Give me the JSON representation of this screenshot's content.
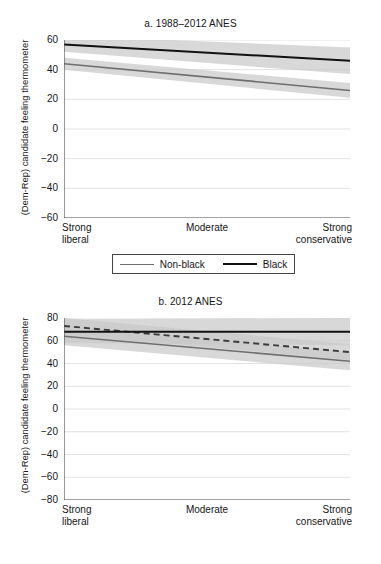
{
  "figure": {
    "background": "#ffffff",
    "colors": {
      "black_line": "#111111",
      "nonblack_line": "#6e6e6e",
      "online_line": "#3a3a3a",
      "ci_band": "#c9c9c9",
      "gridline": "#e2e2e2",
      "axis": "#555555",
      "text": "#151515"
    }
  },
  "chart_data": [
    {
      "type": "line",
      "panel": "a",
      "title": "a. 1988–2012 ANES",
      "xlabel": "",
      "ylabel": "(Dem-Rep) candidate feeling thermometer",
      "x": [
        0,
        1
      ],
      "xlim": [
        0,
        1
      ],
      "ylim": [
        -60,
        60
      ],
      "yticks": [
        60,
        40,
        20,
        0,
        -20,
        -40,
        -60
      ],
      "ytick_labels": [
        "60",
        "40",
        "20",
        "0",
        "−20",
        "−40",
        "−60"
      ],
      "xtick_positions": [
        0,
        0.5,
        1
      ],
      "xtick_labels": [
        "Strong\nliberal",
        "Moderate",
        "Strong\nconservative"
      ],
      "grid": true,
      "grid_axis": "y",
      "legend_position": "below",
      "series": [
        {
          "name": "Non-black",
          "style": "solid",
          "color": "#6e6e6e",
          "values": [
            44,
            26
          ],
          "ci_lower": [
            40,
            21
          ],
          "ci_upper": [
            48,
            31
          ]
        },
        {
          "name": "Black",
          "style": "solid",
          "color": "#111111",
          "values": [
            57,
            46
          ],
          "ci_lower": [
            52,
            37
          ],
          "ci_upper": [
            63,
            55
          ]
        }
      ]
    },
    {
      "type": "line",
      "panel": "b",
      "title": "b. 2012 ANES",
      "xlabel": "",
      "ylabel": "(Dem-Rep) candidate feeling thermometer",
      "x": [
        0,
        1
      ],
      "xlim": [
        0,
        1
      ],
      "ylim": [
        -80,
        80
      ],
      "yticks": [
        80,
        60,
        40,
        20,
        0,
        -20,
        -40,
        -60,
        -80
      ],
      "ytick_labels": [
        "80",
        "60",
        "40",
        "20",
        "0",
        "−20",
        "−40",
        "−60",
        "−80"
      ],
      "xtick_positions": [
        0,
        0.5,
        1
      ],
      "xtick_labels": [
        "Strong\nliberal",
        "Moderate",
        "Strong\nconservative"
      ],
      "grid": true,
      "grid_axis": "y",
      "legend_position": "below",
      "series": [
        {
          "name": "Online (control)",
          "style": "dashed",
          "color": "#3a3a3a",
          "values": [
            73,
            50
          ],
          "ci_lower": [
            66,
            43
          ],
          "ci_upper": [
            80,
            57
          ]
        },
        {
          "name": "Non-black",
          "style": "solid",
          "color": "#6e6e6e",
          "values": [
            64,
            42
          ],
          "ci_lower": [
            56,
            34
          ],
          "ci_upper": [
            71,
            50
          ]
        },
        {
          "name": "Black",
          "style": "solid",
          "color": "#111111",
          "values": [
            68,
            68
          ],
          "ci_lower": [
            58,
            56
          ],
          "ci_upper": [
            79,
            80
          ]
        }
      ]
    }
  ],
  "panel_a": {
    "title": "a. 1988–2012 ANES",
    "ylabel": "(Dem-Rep) candidate feeling thermometer",
    "ytick_labels": [
      "60",
      "40",
      "20",
      "0",
      "−20",
      "−40",
      "−60"
    ],
    "xtick_labels": {
      "left_line1": "Strong",
      "left_line2": "liberal",
      "middle": "Moderate",
      "right_line1": "Strong",
      "right_line2": "conservative"
    },
    "legend": {
      "items": [
        {
          "label": "Non-black",
          "style": "solid-gray"
        },
        {
          "label": "Black",
          "style": "solid-black"
        }
      ]
    }
  },
  "panel_b": {
    "title": "b. 2012 ANES",
    "ylabel": "(Dem-Rep) candidate feeling thermometer",
    "ytick_labels": [
      "80",
      "60",
      "40",
      "20",
      "0",
      "−20",
      "−40",
      "−60",
      "−80"
    ],
    "xtick_labels": {
      "left_line1": "Strong",
      "left_line2": "liberal",
      "middle": "Moderate",
      "right_line1": "Strong",
      "right_line2": "conservative"
    },
    "legend": {
      "items": [
        {
          "label": "Online (control)",
          "style": "dashed"
        },
        {
          "label": "Non-black",
          "style": "solid-gray"
        },
        {
          "label": "Black",
          "style": "solid-black"
        }
      ]
    }
  }
}
